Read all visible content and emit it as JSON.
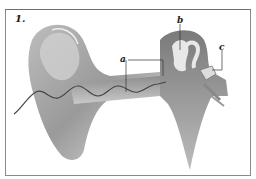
{
  "figure": {
    "number": "1.",
    "labels": [
      {
        "id": "a",
        "text": "a",
        "points_to": "ear canal"
      },
      {
        "id": "b",
        "text": "b",
        "points_to": "middle ear ossicle"
      },
      {
        "id": "c",
        "text": "c",
        "points_to": "inner ear structure"
      }
    ]
  },
  "colors": {
    "frame": "#8a8a8a",
    "tissue_light": "#d8d8d8",
    "tissue_mid": "#a8a8a8",
    "tissue_dark": "#6e6e6e",
    "sound_wave": "#444444",
    "leader_lines": "#333333"
  }
}
